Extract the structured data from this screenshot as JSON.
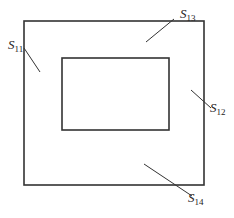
{
  "diagram": {
    "outer_rect": {
      "x": 24,
      "y": 21,
      "w": 180,
      "h": 164
    },
    "inner_rect": {
      "x": 62,
      "y": 58,
      "w": 107,
      "h": 72
    },
    "labels": [
      {
        "id": "S11",
        "main": "S",
        "sub": "11",
        "x": 7,
        "y": 47,
        "line": [
          24,
          48,
          40,
          72
        ]
      },
      {
        "id": "S13",
        "main": "S",
        "sub": "13",
        "x": 180,
        "y": 19,
        "line": [
          174,
          19,
          146,
          42
        ]
      },
      {
        "id": "S12",
        "main": "S",
        "sub": "12",
        "x": 210,
        "y": 112,
        "line": [
          190,
          90,
          212,
          108
        ]
      },
      {
        "id": "S14",
        "main": "S",
        "sub": "14",
        "x": 189,
        "y": 200,
        "line": [
          144,
          164,
          192,
          196
        ]
      }
    ],
    "stroke_color": "#333333"
  }
}
